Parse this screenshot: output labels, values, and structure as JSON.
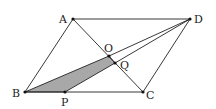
{
  "diagram": {
    "type": "geometry",
    "points": {
      "A": {
        "label": "A",
        "x": 73,
        "y": 19
      },
      "B": {
        "label": "B",
        "x": 25,
        "y": 92
      },
      "C": {
        "label": "C",
        "x": 143,
        "y": 92
      },
      "D": {
        "label": "D",
        "x": 190,
        "y": 19
      },
      "O": {
        "label": "O",
        "x": 109,
        "y": 56
      },
      "Q": {
        "label": "Q",
        "x": 115,
        "y": 63
      },
      "P": {
        "label": "P",
        "x": 65,
        "y": 92
      }
    },
    "segments": [
      "AB",
      "BC",
      "CD",
      "DA",
      "AC",
      "BO",
      "OD",
      "QD",
      "PQ"
    ],
    "shaded_region": [
      "B",
      "O",
      "Q",
      "P"
    ],
    "shade_color": "#a8a8a8",
    "line_color": "#222222"
  }
}
